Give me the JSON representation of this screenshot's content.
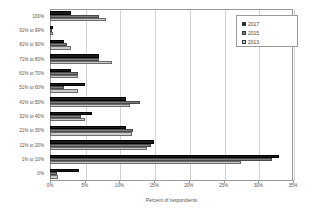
{
  "chart_data": {
    "type": "bar",
    "orientation": "horizontal",
    "title": "",
    "xlabel": "Percent of respondents",
    "ylabel": "",
    "xlim": [
      0,
      35
    ],
    "xticks": [
      "0%",
      "5%",
      "10%",
      "15%",
      "20%",
      "25%",
      "30%",
      "35%"
    ],
    "xtick_values": [
      0,
      5,
      10,
      15,
      20,
      25,
      30,
      35
    ],
    "grid": true,
    "legend_position": "top-right",
    "categories": [
      "100%",
      "91% to 99%",
      "81% to 90%",
      "71% to 80%",
      "61% to 70%",
      "51% to 60%",
      "41% to 50%",
      "31% to 40%",
      "21% to 30%",
      "11% to 20%",
      "1% to 10%",
      "0%"
    ],
    "series": [
      {
        "name": "2017",
        "color": "#1a1a1a",
        "values": [
          3.0,
          0.4,
          2.0,
          7.0,
          3.0,
          5.0,
          11.0,
          6.0,
          11.0,
          15.0,
          33.0,
          4.2
        ]
      },
      {
        "name": "2015",
        "color": "#7d7d7d",
        "values": [
          7.0,
          0.3,
          2.4,
          7.0,
          4.0,
          2.0,
          13.0,
          4.5,
          12.0,
          14.5,
          32.0,
          1.0
        ]
      },
      {
        "name": "2013",
        "color": "#c9c9c9",
        "values": [
          8.0,
          0.5,
          3.0,
          9.0,
          4.0,
          4.0,
          11.5,
          5.0,
          11.8,
          14.0,
          27.5,
          1.2
        ]
      }
    ]
  },
  "legend": {
    "items": [
      {
        "label": "2017"
      },
      {
        "label": "2015"
      },
      {
        "label": "2013"
      }
    ]
  }
}
